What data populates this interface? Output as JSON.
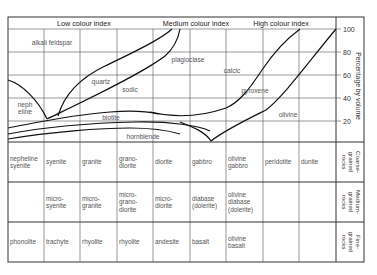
{
  "header": {
    "low": "Low colour index",
    "medium": "Medium colour index",
    "high": "High colour index"
  },
  "axis": {
    "ylabel": "Percentage by volume",
    "ticks": [
      "100",
      "80",
      "60",
      "40",
      "20"
    ]
  },
  "minerals": {
    "alkali_feldspar": "alkali feldspar",
    "plagioclase": "plagioclase",
    "quartz": "quartz",
    "sodic": "sodic",
    "calcic": "calcic",
    "neph": "neph",
    "eline": "eline",
    "biotite": "biotite",
    "hornblende": "hornblende",
    "pyroxene": "pyroxene",
    "olivine": "olivine"
  },
  "table": {
    "row_labels": [
      [
        "Coarse-",
        "grained",
        "rocks"
      ],
      [
        "Medium-",
        "grained",
        "rocks"
      ],
      [
        "Fine-",
        "grained",
        "rocks"
      ]
    ],
    "rows": [
      [
        [
          "nepheline",
          "syenite"
        ],
        [
          "syenite"
        ],
        [
          "granite"
        ],
        [
          "grano-",
          "diorite"
        ],
        [
          "diorite"
        ],
        [
          "gabbro"
        ],
        [
          "olivine",
          "gabbro"
        ],
        [
          "peridotite"
        ],
        [
          "dunite"
        ]
      ],
      [
        [],
        [
          "micro-",
          "syenite"
        ],
        [
          "micro-",
          "granite"
        ],
        [
          "micro-",
          "grano-",
          "diorite"
        ],
        [
          "micro-",
          "diorite"
        ],
        [
          "diabase",
          "(dolerite)"
        ],
        [
          "olivine",
          "diabase",
          "(dolerite)"
        ],
        [],
        []
      ],
      [
        [
          "phonolite"
        ],
        [
          "trachyte"
        ],
        [
          "rhyolite"
        ],
        [
          "rhyolite"
        ],
        [
          "andesite"
        ],
        [
          "basalt"
        ],
        [
          "olivine",
          "basalt"
        ],
        [],
        []
      ]
    ]
  },
  "chart_data": {
    "type": "area",
    "xlabel": "",
    "ylabel": "Percentage by volume",
    "ylim": [
      0,
      100
    ],
    "yticks": [
      20,
      40,
      60,
      80,
      100
    ],
    "colour_index_bands": [
      "Low colour index",
      "Medium colour index",
      "High colour index"
    ],
    "regions": [
      "alkali feldspar",
      "nepheline",
      "quartz",
      "plagioclase (sodic)",
      "plagioclase (calcic)",
      "biotite",
      "hornblende",
      "pyroxene",
      "olivine"
    ],
    "columns": [
      "nepheline syenite",
      "syenite",
      "granite",
      "granodiorite",
      "diorite",
      "gabbro",
      "olivine gabbro",
      "peridotite",
      "dunite"
    ],
    "grid": true
  }
}
